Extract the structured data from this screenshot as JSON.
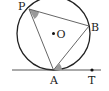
{
  "diagram": {
    "type": "geometry-tangent-chord",
    "labels": {
      "P": "P",
      "B": "B",
      "O": "O",
      "A": "A",
      "T": "T"
    },
    "points": {
      "P": [
        29,
        9
      ],
      "B": [
        89,
        26
      ],
      "O": [
        53.5,
        33.5
      ],
      "A": [
        53.5,
        70
      ],
      "T": [
        92,
        70
      ]
    },
    "circle": {
      "cx": 53.5,
      "cy": 33.5,
      "r": 36.5
    },
    "tangent_line": {
      "x1": 12,
      "y1": 70,
      "x2": 101,
      "y2": 70
    },
    "marked_angles": [
      "angle APB",
      "angle BAT"
    ],
    "colors": {
      "stroke": "#222222",
      "angle_fill": "#9a9a9a"
    }
  }
}
